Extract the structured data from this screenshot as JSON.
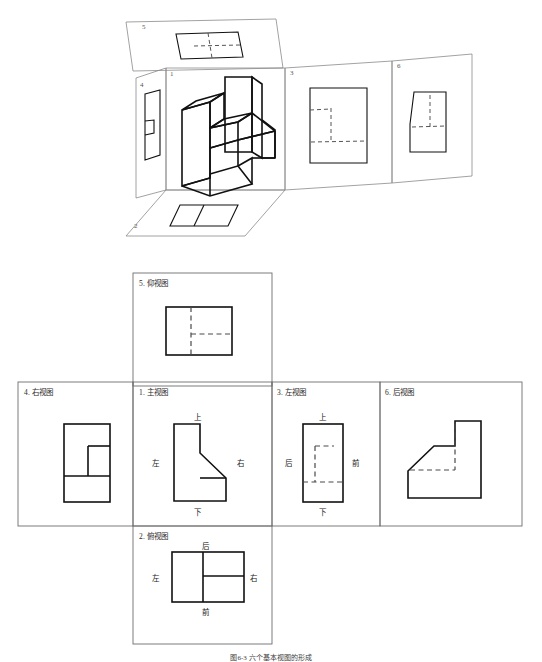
{
  "figure": {
    "caption": "图6-3 六个基本视图的形成",
    "top_diagram": {
      "name": "六面投影展开图",
      "panel_numbers": [
        "5",
        "1",
        "3",
        "6",
        "4",
        "2"
      ]
    }
  },
  "views": [
    {
      "id": "5",
      "label": "5. 仰视图",
      "position": "top-center",
      "directions": []
    },
    {
      "id": "4",
      "label": "4. 右视图",
      "position": "middle-far-left",
      "directions": []
    },
    {
      "id": "1",
      "label": "1. 主视图",
      "position": "middle-center-left",
      "directions": [
        {
          "key": "up",
          "text": "上"
        },
        {
          "key": "left",
          "text": "左"
        },
        {
          "key": "right",
          "text": "右"
        },
        {
          "key": "down",
          "text": "下"
        }
      ]
    },
    {
      "id": "3",
      "label": "3. 左视图",
      "position": "middle-center-right",
      "directions": [
        {
          "key": "up",
          "text": "上"
        },
        {
          "key": "left",
          "text": "后"
        },
        {
          "key": "right",
          "text": "前"
        },
        {
          "key": "down",
          "text": "下"
        }
      ]
    },
    {
      "id": "6",
      "label": "6. 后视图",
      "position": "middle-far-right",
      "directions": []
    },
    {
      "id": "2",
      "label": "2. 俯视图",
      "position": "bottom-center",
      "directions": [
        {
          "key": "up",
          "text": "后"
        },
        {
          "key": "left",
          "text": "左"
        },
        {
          "key": "right",
          "text": "右"
        },
        {
          "key": "down",
          "text": "前"
        }
      ]
    }
  ],
  "colors": {
    "solid_line": "#111111",
    "hidden_line": "#4a4a4a",
    "fold_line": "#8a8a8a",
    "panel_border": "#6e6e6e",
    "text": "#1a1a1a",
    "background": "#ffffff"
  }
}
